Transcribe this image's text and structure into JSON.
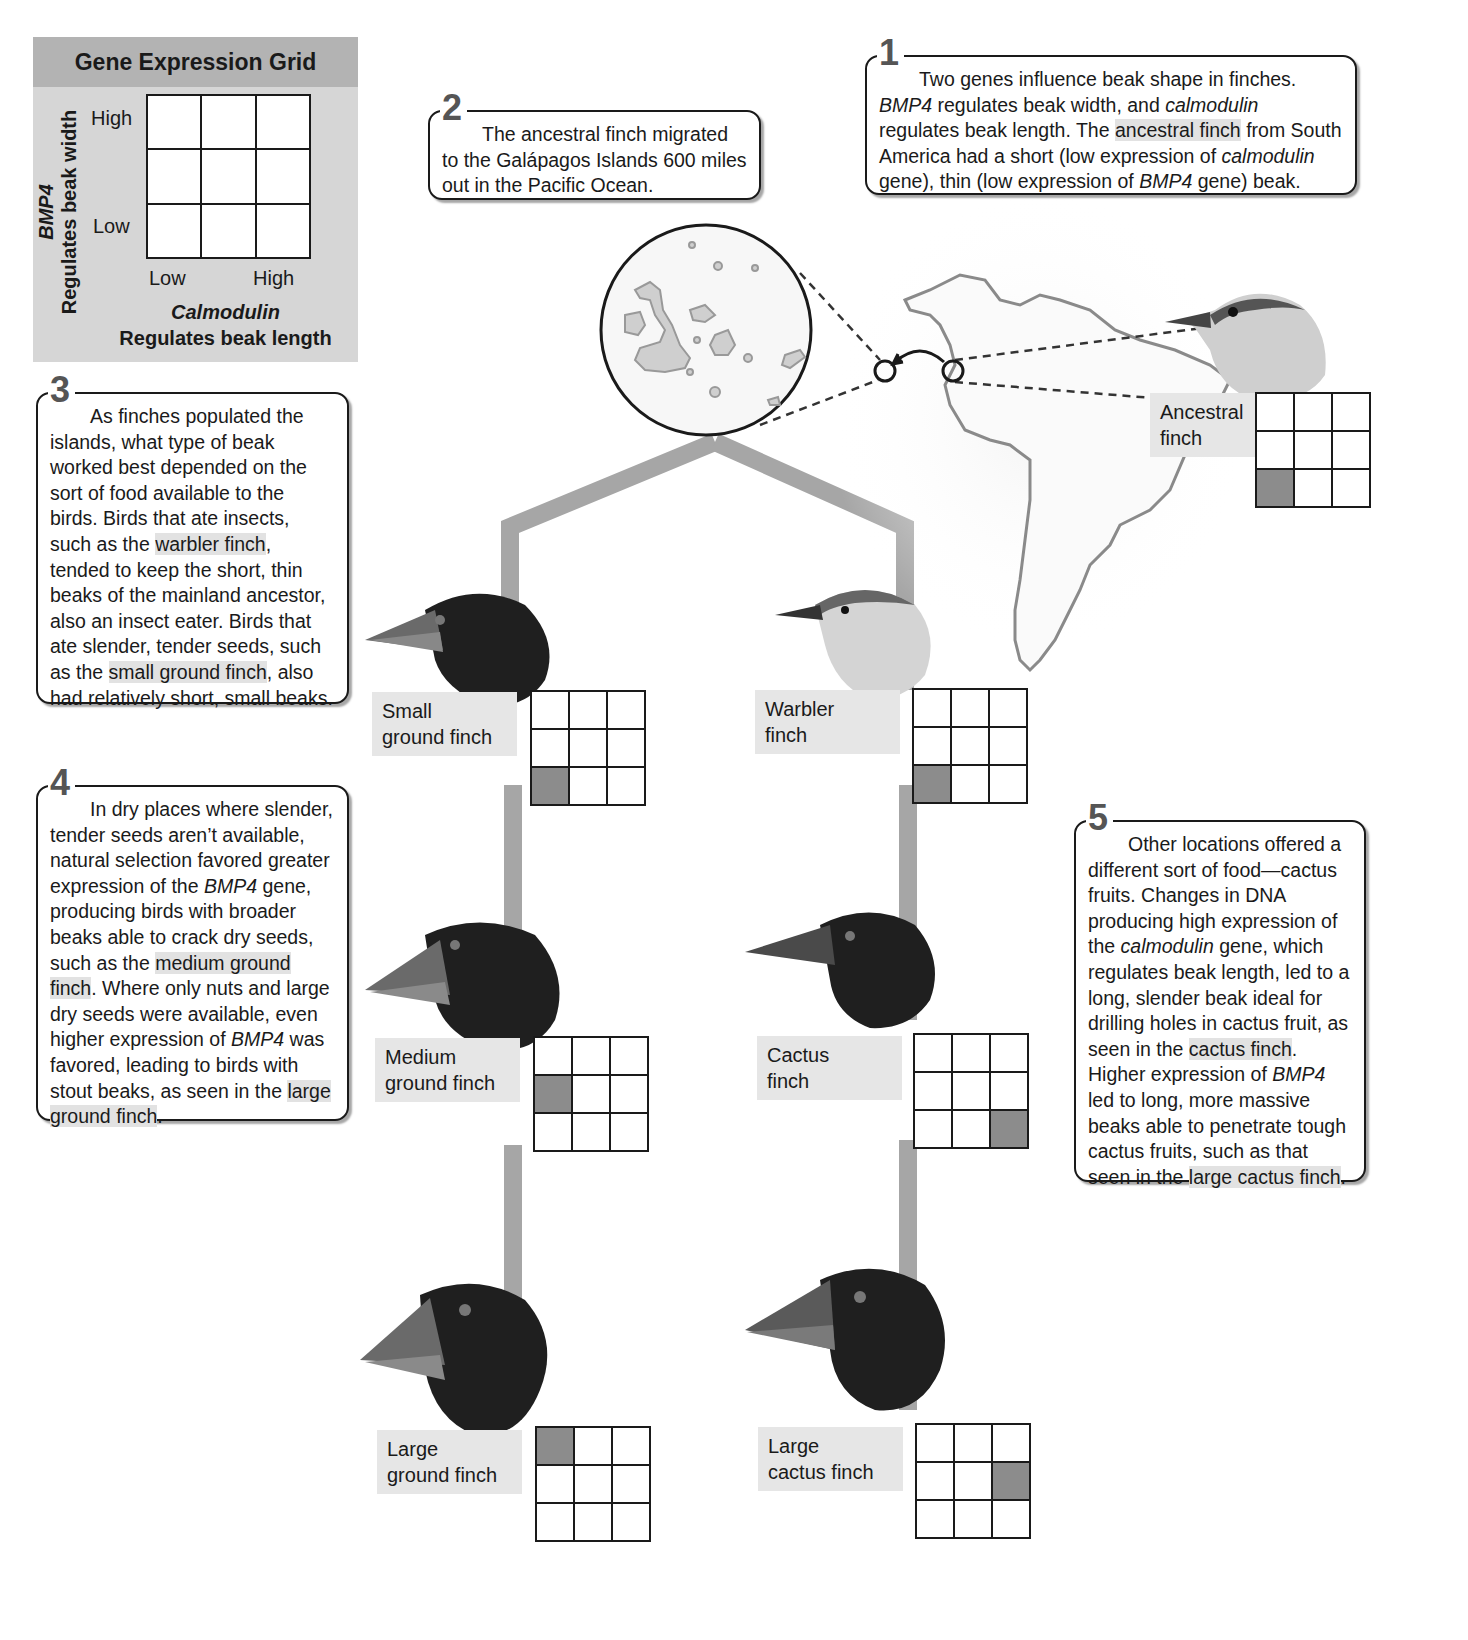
{
  "legend": {
    "title": "Gene Expression Grid",
    "y_gene": "BMP4",
    "y_desc": "Regulates beak width",
    "x_gene": "Calmodulin",
    "x_desc": "Regulates beak length",
    "row_high": "High",
    "row_low": "Low",
    "col_low": "Low",
    "col_high": "High"
  },
  "callouts": {
    "c1": {
      "num": "1",
      "parts": [
        "Two genes influence beak shape in finches. ",
        "BMP4",
        " regulates beak width, and ",
        "calmodulin",
        " regulates beak length. The ",
        "ancestral finch",
        " from South America had a short (low expression of ",
        "calmodulin",
        " gene), thin (low expression of ",
        "BMP4",
        " gene) beak."
      ]
    },
    "c2": {
      "num": "2",
      "text": "The ancestral finch migrated to the Galápagos Islands 600 miles out in the Pacific Ocean."
    },
    "c3": {
      "num": "3",
      "parts": [
        "As finches populated the islands, what type of beak worked best depended on the sort of food available to the birds. Birds that ate insects, such as the ",
        "warbler finch",
        ", tended to keep the short, thin beaks of the mainland ancestor, also an insect eater. Birds that ate slender, tender seeds, such as the ",
        "small ground finch",
        ", also had relatively short, small beaks."
      ]
    },
    "c4": {
      "num": "4",
      "parts": [
        "In dry places where slender, tender seeds aren’t available, natural selection favored greater expression of the ",
        "BMP4",
        " gene, producing birds with broader beaks able to crack dry seeds, such as the ",
        "medium ground finch",
        ". Where only nuts and large dry seeds were available, even higher expression of ",
        "BMP4",
        " was favored, leading to birds with stout beaks, as seen in the ",
        "large ground finch",
        "."
      ]
    },
    "c5": {
      "num": "5",
      "parts": [
        "Other locations offered a different sort of food—cactus fruits. Changes in DNA producing high expression of the ",
        "calmodulin",
        " gene, which regulates beak length, led to a long, slender beak ideal for drilling holes in cactus fruit, as seen in the ",
        "cactus finch",
        ". Higher expression of ",
        "BMP4",
        " led to long, more massive beaks able to penetrate tough cactus fruits, such as that seen in the ",
        "large cactus finch",
        "."
      ]
    }
  },
  "finches": [
    {
      "id": "ancestral",
      "line1": "Ancestral",
      "line2": "finch",
      "shaded": [
        6
      ]
    },
    {
      "id": "small-ground",
      "line1": "Small",
      "line2": "ground finch",
      "shaded": [
        6
      ]
    },
    {
      "id": "warbler",
      "line1": "Warbler",
      "line2": "finch",
      "shaded": [
        6
      ]
    },
    {
      "id": "medium-ground",
      "line1": "Medium",
      "line2": "ground finch",
      "shaded": [
        3
      ]
    },
    {
      "id": "cactus",
      "line1": "Cactus",
      "line2": "finch",
      "shaded": [
        8
      ]
    },
    {
      "id": "large-ground",
      "line1": "Large",
      "line2": "ground finch",
      "shaded": [
        0
      ]
    },
    {
      "id": "large-cactus",
      "line1": "Large",
      "line2": "cactus finch",
      "shaded": [
        5
      ]
    }
  ],
  "colors": {
    "branch": "#a6a6a6",
    "shaded_cell": "#8c8c8c",
    "label_bg": "#e6e6e6",
    "legend_bg": "#d6d6d6",
    "legend_header": "#b3b3b3"
  }
}
